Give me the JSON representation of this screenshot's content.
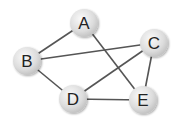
{
  "graph": {
    "nodes": [
      {
        "id": "A",
        "label": "A",
        "x": 84,
        "y": 23
      },
      {
        "id": "B",
        "label": "B",
        "x": 27,
        "y": 61
      },
      {
        "id": "C",
        "label": "C",
        "x": 154,
        "y": 43
      },
      {
        "id": "D",
        "label": "D",
        "x": 73,
        "y": 99
      },
      {
        "id": "E",
        "label": "E",
        "x": 143,
        "y": 100
      }
    ],
    "edges": [
      {
        "from": "A",
        "to": "B"
      },
      {
        "from": "A",
        "to": "E"
      },
      {
        "from": "B",
        "to": "C"
      },
      {
        "from": "B",
        "to": "D"
      },
      {
        "from": "C",
        "to": "D"
      },
      {
        "from": "C",
        "to": "E"
      },
      {
        "from": "D",
        "to": "E"
      }
    ],
    "style": {
      "node_fill_light": "#f4f4f4",
      "node_fill_dark": "#c8c8c8",
      "edge_color": "#555555",
      "label_color": "#222222"
    }
  }
}
